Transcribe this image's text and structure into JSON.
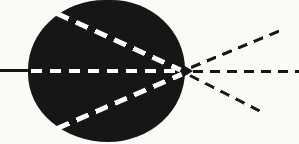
{
  "figure": {
    "name": "rays-through-dark-sphere-diagram",
    "background": "#fbfaf7",
    "ink_color": "#161616",
    "dash_color_inside": "#ffffff",
    "sphere": {
      "x": 28,
      "y": 0,
      "w": 157,
      "h": 142,
      "color": "#161616"
    },
    "rays": [
      {
        "name": "incident-ray",
        "x": 0,
        "y": 70.5,
        "length": 33,
        "angle": 0,
        "thickness": 2.5,
        "color": "#161616",
        "pattern": "solid"
      },
      {
        "name": "internal-axial-ray",
        "x": 31,
        "y": 71,
        "length": 150,
        "angle": 0,
        "thickness": 4,
        "color": "#ffffff",
        "pattern": "dashed",
        "dash": 11,
        "gap": 8
      },
      {
        "name": "internal-upper-ray",
        "x": 57,
        "y": 13,
        "length": 136,
        "angle": 24.6,
        "thickness": 4.5,
        "color": "#ffffff",
        "pattern": "dashed",
        "dash": 13,
        "gap": 8
      },
      {
        "name": "internal-lower-ray",
        "x": 57,
        "y": 128,
        "length": 136,
        "angle": -23.5,
        "thickness": 4.5,
        "color": "#ffffff",
        "pattern": "dashed",
        "dash": 13,
        "gap": 8
      },
      {
        "name": "emergent-upper-ray",
        "x": 191,
        "y": 67,
        "length": 96,
        "angle": -22.5,
        "thickness": 3,
        "color": "#161616",
        "pattern": "dashed",
        "dash": 10,
        "gap": 7
      },
      {
        "name": "emergent-axial-ray",
        "x": 193,
        "y": 71,
        "length": 106,
        "angle": 0,
        "thickness": 3,
        "color": "#161616",
        "pattern": "dashed",
        "dash": 10,
        "gap": 7
      },
      {
        "name": "emergent-lower-ray",
        "x": 190,
        "y": 75,
        "length": 84,
        "angle": 27,
        "thickness": 3,
        "color": "#161616",
        "pattern": "dashed",
        "dash": 10,
        "gap": 7
      }
    ]
  }
}
